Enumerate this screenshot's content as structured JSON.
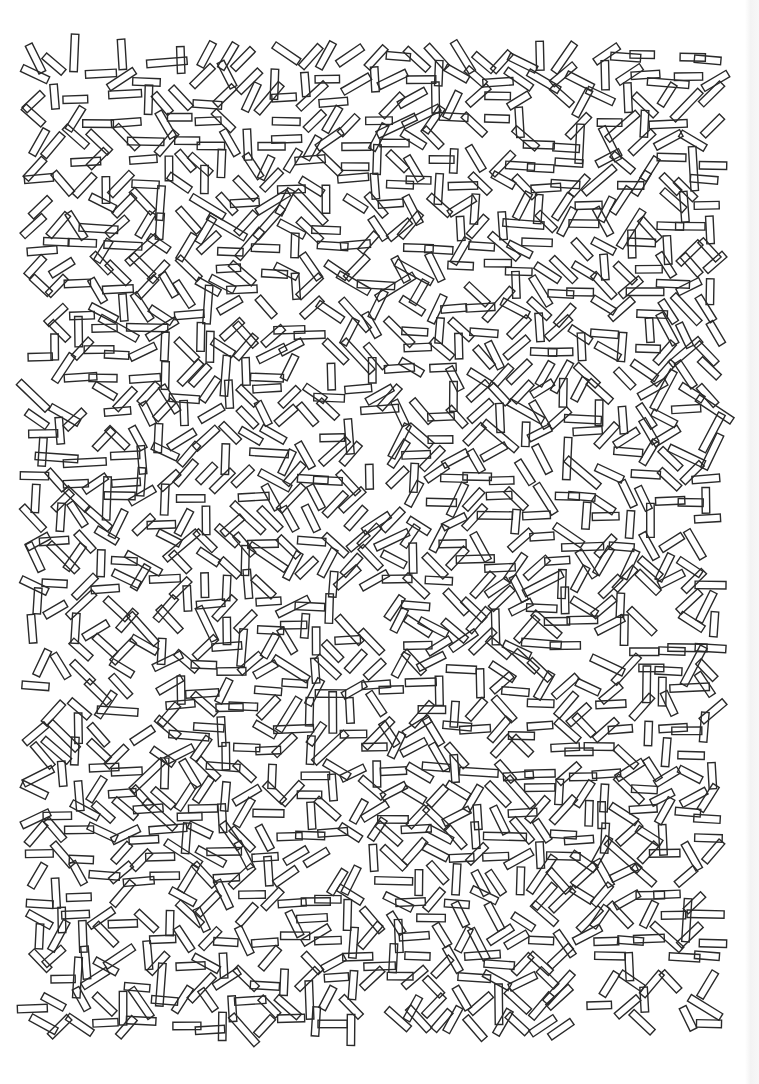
{
  "artwork": {
    "type": "generative-pattern",
    "background": "#ffffff",
    "stroke_color": "#2a2a2a",
    "stroke_width": 1.4,
    "shape": "rectangle-outline",
    "rect_width": 7.5,
    "rect_length_range": [
      24,
      44
    ],
    "area": {
      "x0": 38,
      "y0": 58,
      "x1": 715,
      "y1": 1040
    },
    "grid_spacing": 21,
    "seed": 7
  },
  "page_edge": {
    "color": "#f3f3f3"
  }
}
